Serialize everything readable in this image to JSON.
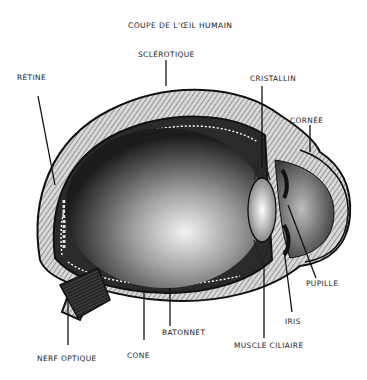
{
  "title": "COUPE DE L'ŒIL HUMAIN",
  "labels": {
    "sclerotique": "SCLÉROTIQUE",
    "retine": "RÉTINE",
    "cristallin": "CRISTALLIN",
    "cornee": "CORNÉE",
    "pupille": "PUPILLE",
    "iris": "IRIS",
    "muscle_ciliaire": "MUSCLE CILIAIRE",
    "batonnet": "BATONNET",
    "cone": "CONE",
    "nerf_optique": "NERF OPTIQUE"
  },
  "colors": {
    "ink": "#111111",
    "paper": "#ffffff"
  }
}
